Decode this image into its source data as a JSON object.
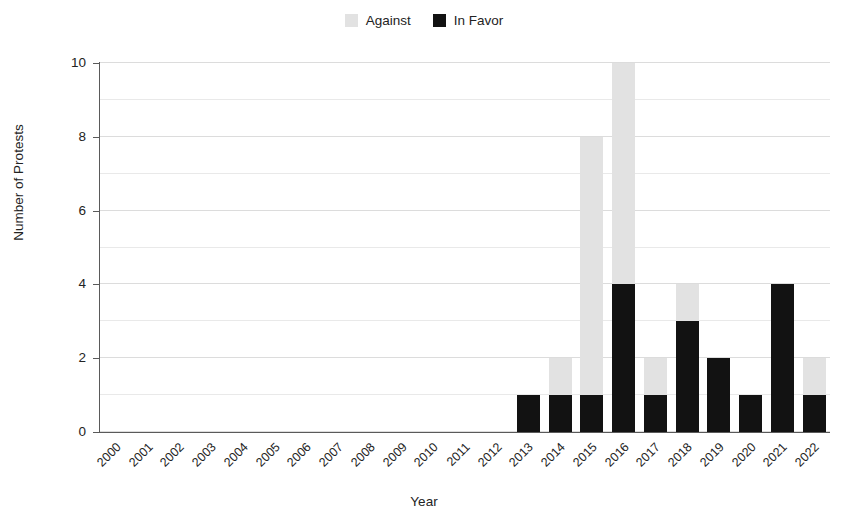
{
  "chart_data": {
    "type": "bar",
    "stacked": true,
    "title": "",
    "xlabel": "Year",
    "ylabel": "Number of Protests",
    "ylim": [
      0,
      10
    ],
    "ytick_values": [
      0,
      2,
      4,
      6,
      8,
      10
    ],
    "ytick_labels": [
      "0",
      "2",
      "4",
      "6",
      "8",
      "10"
    ],
    "grid": "horizontal",
    "legend_position": "top-center",
    "categories": [
      "2000",
      "2001",
      "2002",
      "2003",
      "2004",
      "2005",
      "2006",
      "2007",
      "2008",
      "2009",
      "2010",
      "2011",
      "2012",
      "2013",
      "2014",
      "2015",
      "2016",
      "2017",
      "2018",
      "2019",
      "2020",
      "2021",
      "2022"
    ],
    "series": [
      {
        "name": "In Favor",
        "color": "#121212",
        "values": [
          0,
          0,
          0,
          0,
          0,
          0,
          0,
          0,
          0,
          0,
          0,
          0,
          0,
          1,
          1,
          1,
          4,
          1,
          3,
          2,
          1,
          4,
          1
        ]
      },
      {
        "name": "Against",
        "color": "#e2e2e2",
        "values": [
          0,
          0,
          0,
          0,
          0,
          0,
          0,
          0,
          0,
          0,
          0,
          0,
          0,
          0,
          1,
          7,
          6,
          1,
          1,
          0,
          0,
          0,
          1
        ]
      }
    ],
    "stack_totals": [
      0,
      0,
      0,
      0,
      0,
      0,
      0,
      0,
      0,
      0,
      0,
      0,
      0,
      1,
      2,
      8,
      10,
      2,
      4,
      2,
      1,
      4,
      2
    ],
    "annotations": []
  },
  "legend": {
    "items": [
      {
        "label": "Against",
        "swatch": "legend-swatch-against"
      },
      {
        "label": "In Favor",
        "swatch": "legend-swatch-in-favor"
      }
    ]
  },
  "colors": {
    "against": "#e2e2e2",
    "in_favor": "#121212",
    "axis": "#5a5a5a",
    "grid_major": "#dcdcdc",
    "grid_minor": "#e9e9e9",
    "text": "#232323",
    "background": "#ffffff"
  }
}
